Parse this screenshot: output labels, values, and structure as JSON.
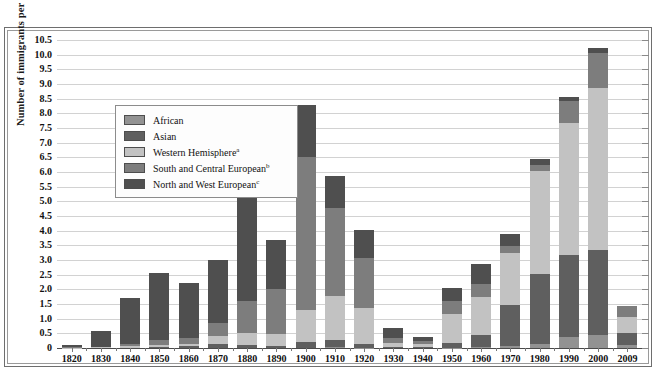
{
  "chart_data": {
    "type": "bar",
    "subtype": "stacked",
    "title": "",
    "xlabel": "",
    "ylabel": "Number of immigrants per decade (in millions)",
    "ylim": [
      0,
      10.5
    ],
    "ytick_step": 0.5,
    "grid": true,
    "legend_position": "inside-top-left",
    "ytick_labels": [
      "10.5",
      "10.0",
      "9.5",
      "9.0",
      "8.5",
      "8.0",
      "7.5",
      "7.0",
      "6.5",
      "6.0",
      "5.5",
      "5.0",
      "4.5",
      "4.0",
      "3.5",
      "3.0",
      "2.5",
      "2.0",
      "1.5",
      "1.0",
      "0.5",
      "0"
    ],
    "categories": [
      "1820",
      "1830",
      "1840",
      "1850",
      "1860",
      "1870",
      "1880",
      "1890",
      "1900",
      "1910",
      "1920",
      "1930",
      "1940",
      "1950",
      "1960",
      "1970",
      "1980",
      "1990",
      "2000",
      "2009"
    ],
    "series": [
      {
        "name": "North and West European",
        "legend_label": "North and West European",
        "footnote_marker": "c",
        "color": "#4f4f4f",
        "values": [
          0.09,
          0.55,
          1.55,
          2.3,
          1.9,
          2.15,
          3.8,
          1.65,
          1.8,
          1.1,
          0.95,
          0.32,
          0.15,
          0.45,
          0.7,
          0.4,
          0.2,
          0.16,
          0.17,
          0.0
        ]
      },
      {
        "name": "South and Central European",
        "legend_label": "South and Central European",
        "footnote_marker": "b",
        "color": "#7d7d7d",
        "values": [
          0.01,
          0.02,
          0.06,
          0.15,
          0.2,
          0.45,
          1.1,
          1.55,
          5.2,
          3.0,
          1.7,
          0.18,
          0.1,
          0.45,
          0.45,
          0.25,
          0.2,
          0.75,
          1.2,
          0.4
        ]
      },
      {
        "name": "Western Hemisphere",
        "legend_label": "Western Hemisphere",
        "footnote_marker": "a",
        "color": "#c2c2c2",
        "values": [
          0.01,
          0.02,
          0.08,
          0.07,
          0.07,
          0.28,
          0.4,
          0.4,
          1.1,
          1.5,
          1.25,
          0.15,
          0.12,
          1.0,
          1.3,
          1.75,
          3.5,
          4.5,
          5.5,
          0.55
        ]
      },
      {
        "name": "Asian",
        "legend_label": "Asian",
        "footnote_marker": "",
        "color": "#5f5f5f",
        "values": [
          0.0,
          0.0,
          0.0,
          0.04,
          0.06,
          0.12,
          0.1,
          0.07,
          0.2,
          0.25,
          0.12,
          0.02,
          0.02,
          0.15,
          0.4,
          1.4,
          2.4,
          2.8,
          2.9,
          0.4
        ]
      },
      {
        "name": "African",
        "legend_label": "African",
        "footnote_marker": "",
        "color": "#929292",
        "values": [
          0.0,
          0.0,
          0.0,
          0.0,
          0.0,
          0.0,
          0.0,
          0.0,
          0.0,
          0.02,
          0.01,
          0.0,
          0.0,
          0.01,
          0.03,
          0.08,
          0.14,
          0.36,
          0.45,
          0.1
        ]
      }
    ],
    "totals": [
      "0.1",
      "0.6",
      "1.7",
      "2.6",
      "2.2",
      "3.0",
      "5.4",
      "3.7",
      "8.8",
      "5.8",
      "4.1",
      "0.5",
      "0.9",
      "2.6",
      "3.2",
      "4.4",
      "7.2",
      "9.0",
      "10.2",
      "1.5"
    ]
  },
  "legend": {
    "items": [
      {
        "label": "African",
        "footnote": "",
        "color": "#929292"
      },
      {
        "label": "Asian",
        "footnote": "",
        "color": "#5f5f5f"
      },
      {
        "label": "Western Hemisphere",
        "footnote": "a",
        "color": "#c2c2c2"
      },
      {
        "label": "South and Central European",
        "footnote": "b",
        "color": "#7d7d7d"
      },
      {
        "label": "North and West European",
        "footnote": "c",
        "color": "#4f4f4f"
      }
    ]
  }
}
